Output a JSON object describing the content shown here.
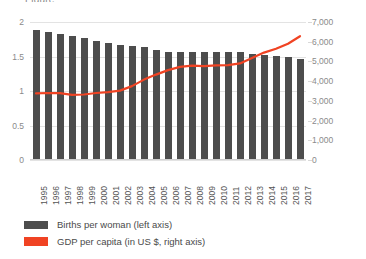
{
  "heading_fragment": "Figure",
  "chart_data": {
    "type": "bar",
    "title": "",
    "subtitle": "",
    "xlabel": "",
    "categories": [
      "1995",
      "1996",
      "1997",
      "1998",
      "1999",
      "2000",
      "2001",
      "2002",
      "2003",
      "2004",
      "2005",
      "2006",
      "2007",
      "2008",
      "2009",
      "2010",
      "2011",
      "2012",
      "2013",
      "2014",
      "2015",
      "2016",
      "2017"
    ],
    "grid": true,
    "legend_position": "bottom-left",
    "left_axis": {
      "label": "Births per woman",
      "ylim": [
        0,
        2
      ],
      "ticks": [
        "0",
        "0.5",
        "1",
        "1.5",
        "2"
      ],
      "tick_values": [
        0,
        0.5,
        1,
        1.5,
        2
      ]
    },
    "right_axis": {
      "label": "GDP per capita (in US $)",
      "ylim": [
        0,
        7000
      ],
      "ticks": [
        "0",
        "1,000",
        "2,000",
        "3,000",
        "4,000",
        "5,000",
        "6,000",
        "7,000"
      ],
      "tick_values": [
        0,
        1000,
        2000,
        3000,
        4000,
        5000,
        6000,
        7000
      ]
    },
    "series": [
      {
        "name": "Births per woman (left axis)",
        "type": "bar",
        "axis": "left",
        "color": "#4d4d4d",
        "values": [
          1.89,
          1.86,
          1.83,
          1.8,
          1.77,
          1.73,
          1.7,
          1.67,
          1.65,
          1.64,
          1.6,
          1.57,
          1.56,
          1.56,
          1.56,
          1.56,
          1.56,
          1.57,
          1.53,
          1.52,
          1.51,
          1.49,
          1.47
        ]
      },
      {
        "name": "GDP per capita (in US $, right axis)",
        "type": "line",
        "axis": "right",
        "color": "#f04323",
        "values": [
          3380,
          3400,
          3390,
          3300,
          3320,
          3400,
          3440,
          3520,
          3750,
          4080,
          4330,
          4560,
          4720,
          4790,
          4760,
          4800,
          4810,
          4900,
          5180,
          5450,
          5640,
          5900,
          6280
        ]
      }
    ]
  },
  "legend": {
    "items": [
      {
        "label": "Births per woman (left axis)",
        "color": "#4d4d4d"
      },
      {
        "label": "GDP per capita (in US $, right axis)",
        "color": "#f04323"
      }
    ]
  }
}
